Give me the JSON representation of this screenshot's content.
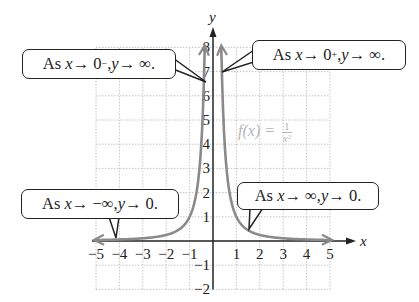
{
  "chart_data": {
    "type": "line",
    "title": "",
    "function_label": "f(x) = 1/x^2",
    "xlabel": "x",
    "ylabel": "y",
    "xlim": [
      -5,
      5
    ],
    "ylim": [
      -2,
      8
    ],
    "grid": true,
    "x_ticks": [
      -5,
      -4,
      -3,
      -2,
      -1,
      1,
      2,
      3,
      4,
      5
    ],
    "y_ticks": [
      -2,
      -1,
      1,
      2,
      3,
      4,
      5,
      6,
      7,
      8
    ],
    "series": [
      {
        "name": "f(x) = 1/x^2",
        "color": "#8a8a8a",
        "x": [
          -5,
          -4,
          -3,
          -2,
          -1,
          -0.5,
          -0.354,
          0.354,
          0.5,
          1,
          2,
          3,
          4,
          5
        ],
        "y": [
          0.04,
          0.0625,
          0.111,
          0.25,
          1,
          4,
          8,
          8,
          4,
          1,
          0.25,
          0.111,
          0.0625,
          0.04
        ]
      }
    ],
    "annotations": [
      {
        "text": "As x → 0⁻, y → ∞.",
        "points_to": "left branch near y-axis"
      },
      {
        "text": "As x → 0⁺, y → ∞.",
        "points_to": "right branch near y-axis"
      },
      {
        "text": "As x → −∞, y → 0.",
        "points_to": "left tail near x = -4"
      },
      {
        "text": "As x → ∞, y → 0.",
        "points_to": "right tail near x = 1.5"
      }
    ]
  },
  "labels": {
    "x_axis": "x",
    "y_axis": "y",
    "func_prefix": "f(x) = ",
    "func_num": "1",
    "func_den": "x²",
    "x_tick_labels": [
      "−5",
      "−4",
      "−3",
      "−2",
      "−1",
      "1",
      "2",
      "3",
      "4",
      "5"
    ],
    "y_tick_labels": [
      "−2",
      "−1",
      "1",
      "2",
      "3",
      "4",
      "5",
      "6",
      "7",
      "8"
    ]
  },
  "callouts": [
    {
      "as": "As ",
      "var1": "x",
      "arrow1": " → 0",
      "sup": "−",
      "sep": ", ",
      "var2": "y",
      "arrow2": " → ∞."
    },
    {
      "as": "As ",
      "var1": "x",
      "arrow1": " → 0",
      "sup": "+",
      "sep": ", ",
      "var2": "y",
      "arrow2": " → ∞."
    },
    {
      "as": "As ",
      "var1": "x",
      "arrow1": " → −∞, ",
      "var2": "y",
      "arrow2": " → 0."
    },
    {
      "as": "As ",
      "var1": "x",
      "arrow1": " → ∞, ",
      "var2": "y",
      "arrow2": " → 0."
    }
  ],
  "colors": {
    "curve": "#8a8a8a",
    "axis": "#222222",
    "grid": "#bdbdbd",
    "func_label": "#b5b5b5"
  }
}
